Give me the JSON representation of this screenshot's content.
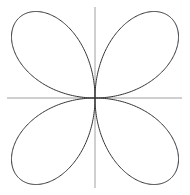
{
  "figure": {
    "curve_color": "#333333",
    "axis_color": "#888888",
    "background": "#ffffff"
  },
  "chart_data": {
    "type": "line",
    "title": "",
    "equation": "r = sin(2θ)",
    "petals": 4,
    "xlabel": "",
    "ylabel": "",
    "xlim": [
      -1,
      1
    ],
    "ylim": [
      -1,
      1
    ],
    "grid": false,
    "axes_visible": true,
    "ticks": false
  }
}
